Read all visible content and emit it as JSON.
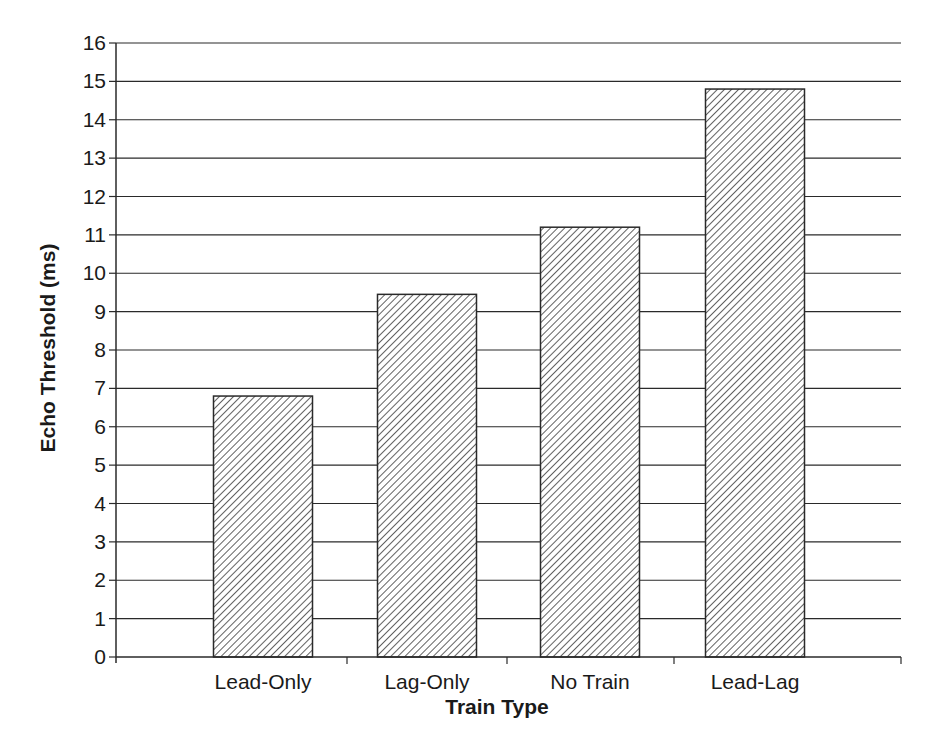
{
  "chart_data": {
    "type": "bar",
    "title": "",
    "xlabel": "Train Type",
    "ylabel": "Echo Threshold (ms)",
    "categories": [
      "Lead-Only",
      "Lag-Only",
      "No Train",
      "Lead-Lag"
    ],
    "values": [
      6.8,
      9.45,
      11.2,
      14.8
    ],
    "ylim": [
      0,
      16
    ],
    "yticks": [
      0,
      1,
      2,
      3,
      4,
      5,
      6,
      7,
      8,
      9,
      10,
      11,
      12,
      13,
      14,
      15,
      16
    ],
    "grid": true,
    "legend": null,
    "bar_fill": "diagonal-hatch",
    "colors": {
      "line": "#2a2a2a",
      "hatch": "#3a3a3a",
      "background": "#ffffff"
    }
  }
}
